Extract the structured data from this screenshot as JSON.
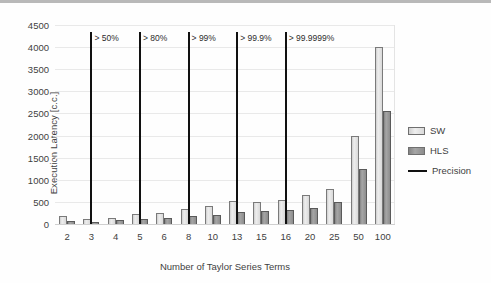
{
  "chart_data": {
    "type": "bar",
    "title": "",
    "xlabel": "Number of Taylor Series Terms",
    "ylabel": "Execution Latency [c.c.]",
    "categories": [
      "2",
      "3",
      "4",
      "5",
      "6",
      "8",
      "10",
      "13",
      "15",
      "16",
      "20",
      "25",
      "50",
      "100"
    ],
    "ylim": [
      0,
      4500
    ],
    "yticks": [
      "0",
      "500",
      "1000",
      "1500",
      "2000",
      "2500",
      "3000",
      "3500",
      "4000",
      "4500"
    ],
    "grid": true,
    "legend_position": "right",
    "series": [
      {
        "name": "SW",
        "type": "bar",
        "color": "#e0e0e0",
        "values": [
          175,
          115,
          145,
          225,
          240,
          345,
          405,
          525,
          495,
          545,
          645,
          790,
          1980,
          4000
        ]
      },
      {
        "name": "HLS",
        "type": "bar",
        "color": "#949494",
        "values": [
          60,
          45,
          80,
          110,
          125,
          175,
          215,
          275,
          300,
          310,
          360,
          500,
          1250,
          2550
        ]
      },
      {
        "name": "Precision",
        "type": "line",
        "color": "#111111",
        "markers": [
          {
            "category": "3",
            "label": "> 50%"
          },
          {
            "category": "5",
            "label": "> 80%"
          },
          {
            "category": "8",
            "label": "> 99%"
          },
          {
            "category": "13",
            "label": "> 99.9%"
          },
          {
            "category": "16",
            "label": "> 99.9999%"
          }
        ]
      }
    ]
  },
  "legend": {
    "items": [
      {
        "label": "SW",
        "kind": "swatch-sw"
      },
      {
        "label": "HLS",
        "kind": "swatch-hls"
      },
      {
        "label": "Precision",
        "kind": "swatch-line"
      }
    ]
  }
}
